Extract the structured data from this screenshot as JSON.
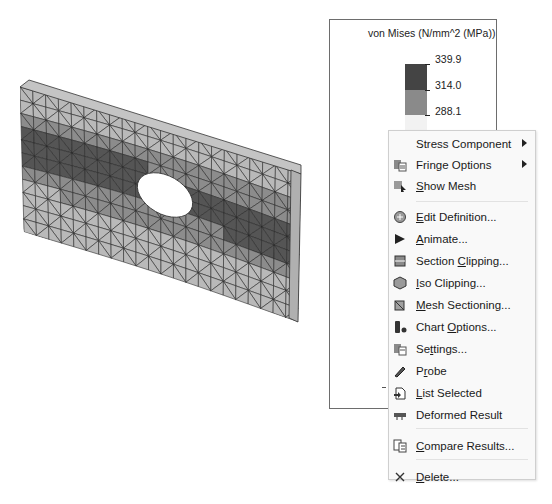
{
  "legend": {
    "title": "von Mises (N/mm^2 (MPa))",
    "entries": [
      {
        "value": "339.9",
        "color": "#444444"
      },
      {
        "value": "314.0",
        "color": "#8a8a8a"
      },
      {
        "value": "288.1",
        "color": "#f2f2f2"
      },
      {
        "value": "262.2",
        "color": "#ffffff"
      }
    ]
  },
  "model": {
    "description": "Plate with hole, deformed mesh with von Mises fringe",
    "colors": {
      "edge": "#2a2a2a",
      "light": "#b9b9b9",
      "mid": "#8c8c8c",
      "dark": "#555555",
      "hole": "#ffffff"
    }
  },
  "context_menu": {
    "items": [
      {
        "label": "Stress Component",
        "u": "",
        "icon": "none",
        "submenu": true
      },
      {
        "label": "Fringe Options",
        "u": "",
        "icon": "fringe-options-icon",
        "submenu": true
      },
      {
        "label": "Show Mesh",
        "u": "S",
        "icon": "show-mesh-icon",
        "submenu": false
      },
      {
        "label": "Edit Definition...",
        "u": "E",
        "icon": "edit-definition-icon",
        "submenu": false
      },
      {
        "label": "Animate...",
        "u": "A",
        "icon": "animate-icon",
        "submenu": false
      },
      {
        "label": "Section Clipping...",
        "u": "C",
        "icon": "section-clipping-icon",
        "submenu": false
      },
      {
        "label": "Iso Clipping...",
        "u": "I",
        "icon": "iso-clipping-icon",
        "submenu": false
      },
      {
        "label": "Mesh Sectioning...",
        "u": "M",
        "icon": "mesh-sectioning-icon",
        "submenu": false
      },
      {
        "label": "Chart Options...",
        "u": "O",
        "icon": "chart-options-icon",
        "submenu": false
      },
      {
        "label": "Settings...",
        "u": "t",
        "icon": "settings-icon",
        "submenu": false
      },
      {
        "label": "Probe",
        "u": "r",
        "icon": "probe-icon",
        "submenu": false
      },
      {
        "label": "List Selected",
        "u": "L",
        "icon": "list-selected-icon",
        "submenu": false
      },
      {
        "label": "Deformed Result",
        "u": "",
        "icon": "deformed-result-icon",
        "submenu": false
      },
      {
        "label": "Compare Results...",
        "u": "C",
        "icon": "compare-results-icon",
        "submenu": false
      },
      {
        "label": "Delete...",
        "u": "D",
        "icon": "delete-icon",
        "submenu": false
      }
    ]
  }
}
